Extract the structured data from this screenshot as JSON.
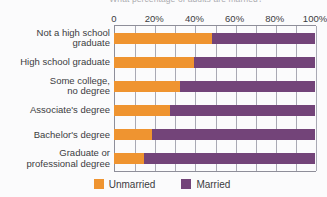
{
  "chart_data": {
    "type": "bar",
    "orientation": "horizontal",
    "stacked": true,
    "stack_total": 100,
    "title": "What percentage of adults are married?",
    "title_clipped": true,
    "xlabel": "",
    "ylabel": "",
    "xlim": [
      0,
      100
    ],
    "xtick_values": [
      0,
      20,
      40,
      60,
      80,
      100
    ],
    "xtick_labels": [
      "0",
      "20%",
      "40%",
      "60%",
      "80%",
      "100%"
    ],
    "minor_tick_step": 10,
    "grid": true,
    "grid_axis": "x",
    "legend_position": "bottom",
    "categories": [
      "Not a high school\ngraduate",
      "High school graduate",
      "Some college,\nno degree",
      "Associate's degree",
      "Bachelor's degree",
      "Graduate or\nprofessional degree"
    ],
    "series": [
      {
        "name": "Unmarried",
        "color": "#ef9430",
        "values": [
          49,
          40,
          33,
          28,
          19,
          15
        ]
      },
      {
        "name": "Married",
        "color": "#734479",
        "values": [
          51,
          60,
          67,
          72,
          81,
          85
        ]
      }
    ]
  },
  "legend": {
    "items": [
      {
        "label": "Unmarried",
        "color": "#ef9430"
      },
      {
        "label": "Married",
        "color": "#734479"
      }
    ]
  },
  "colors": {
    "unmarried": "#ef9430",
    "married": "#734479",
    "background": "#fbfbfc",
    "axis": "#8e8e99",
    "grid": "#a9a9b4",
    "text": "#3b3b41"
  }
}
